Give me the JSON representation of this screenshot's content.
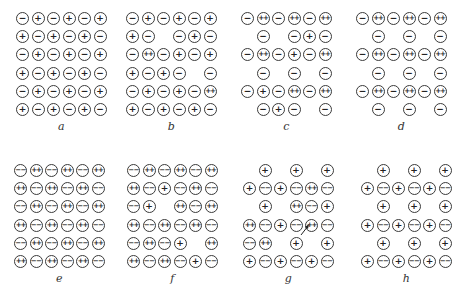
{
  "figure": {
    "panels": [
      {
        "label": "a",
        "origin": [
          16,
          12
        ],
        "rows": [
          [
            "-",
            "+",
            "-",
            "+",
            "-",
            "+"
          ],
          [
            "+",
            "-",
            "+",
            "-",
            "+",
            "-"
          ],
          [
            "-",
            "+",
            "-",
            "+",
            "-",
            "+"
          ],
          [
            "+",
            "-",
            "+",
            "-",
            "+",
            "-"
          ],
          [
            "-",
            "+",
            "-",
            "+",
            "-",
            "+"
          ],
          [
            "+",
            "-",
            "+",
            "-",
            "+",
            "-"
          ]
        ]
      },
      {
        "label": "b",
        "origin": [
          126,
          12
        ],
        "rows": [
          [
            "-",
            "+",
            "-",
            "+",
            "-",
            "+"
          ],
          [
            "+",
            "-",
            "",
            "-",
            "+",
            "-"
          ],
          [
            "-",
            "++",
            "-",
            "+",
            "-",
            "+"
          ],
          [
            "+",
            "-",
            "+",
            "-",
            "",
            "-"
          ],
          [
            "-",
            "+",
            "-",
            "+",
            "-",
            "++"
          ],
          [
            "+",
            "-",
            "+",
            "-",
            "+",
            "-"
          ]
        ]
      },
      {
        "label": "c",
        "origin": [
          241,
          12
        ],
        "rows": [
          [
            "-",
            "++",
            "-",
            "++",
            "-",
            "++"
          ],
          [
            "",
            "-",
            "",
            "-",
            "+",
            "-"
          ],
          [
            "-",
            "++",
            "-",
            "+",
            "-",
            "++"
          ],
          [
            "",
            "-",
            "",
            "-",
            "",
            "-"
          ],
          [
            "-",
            "+",
            "-",
            "++",
            "-",
            "++"
          ],
          [
            "",
            "-",
            "+",
            "-",
            "",
            "-"
          ]
        ]
      },
      {
        "label": "d",
        "origin": [
          356,
          12
        ],
        "rows": [
          [
            "-",
            "++",
            "-",
            "++",
            "-",
            "++"
          ],
          [
            "",
            "-",
            "",
            "-",
            "",
            "-"
          ],
          [
            "-",
            "++",
            "-",
            "++",
            "-",
            "++"
          ],
          [
            "",
            "-",
            "",
            "-",
            "",
            "-"
          ],
          [
            "-",
            "++",
            "-",
            "++",
            "-",
            "++"
          ],
          [
            "",
            "-",
            "",
            "-",
            "",
            "-"
          ]
        ]
      },
      {
        "label": "e",
        "origin": [
          14,
          164
        ],
        "rows": [
          [
            "--",
            "++",
            "--",
            "++",
            "--",
            "++"
          ],
          [
            "++",
            "--",
            "++",
            "--",
            "++",
            "--"
          ],
          [
            "--",
            "++",
            "--",
            "++",
            "--",
            "++"
          ],
          [
            "++",
            "--",
            "++",
            "--",
            "++",
            "--"
          ],
          [
            "--",
            "++",
            "--",
            "++",
            "--",
            "++"
          ],
          [
            "++",
            "--",
            "++",
            "--",
            "++",
            "--"
          ]
        ]
      },
      {
        "label": "f",
        "origin": [
          127,
          164
        ],
        "rows": [
          [
            "--",
            "++",
            "--",
            "++",
            "--",
            "++"
          ],
          [
            "++",
            "--",
            "+",
            "--",
            "++",
            "--"
          ],
          [
            "--",
            "+",
            "",
            "++",
            "--",
            "++"
          ],
          [
            "++",
            "--",
            "++",
            "--",
            "++",
            "--"
          ],
          [
            "--",
            "++",
            "--",
            "+",
            "",
            "++"
          ],
          [
            "++",
            "--",
            "++",
            "--",
            "+",
            "--"
          ]
        ]
      },
      {
        "label": "g",
        "origin": [
          243,
          164
        ],
        "rows": [
          [
            "",
            "+",
            "",
            "+",
            "",
            "+"
          ],
          [
            "+",
            "--",
            "+",
            "--",
            "++",
            "--"
          ],
          [
            "",
            "+",
            "",
            "++",
            "--",
            "+"
          ],
          [
            "++",
            "--",
            "+",
            "--",
            "++",
            "--"
          ],
          [
            "--",
            "++",
            "",
            "+",
            "",
            "+"
          ],
          [
            "+",
            "--",
            "+",
            "--",
            "+",
            "--"
          ]
        ],
        "annotation": "arrow pointing at row 4, column 5 (++ ion)"
      },
      {
        "label": "h",
        "origin": [
          361,
          164
        ],
        "rows": [
          [
            "",
            "+",
            "",
            "+",
            "",
            "+"
          ],
          [
            "+",
            "--",
            "+",
            "--",
            "+",
            "--"
          ],
          [
            "",
            "+",
            "",
            "+",
            "",
            "+"
          ],
          [
            "+",
            "--",
            "+",
            "--",
            "+",
            "--"
          ],
          [
            "",
            "+",
            "",
            "+",
            "",
            "+"
          ],
          [
            "+",
            "--",
            "+",
            "--",
            "+",
            "--"
          ]
        ]
      }
    ],
    "symbols": {
      "+": "+",
      "-": "−",
      "++": "++",
      "--": "−−"
    },
    "colors": {
      "stroke": "#3a3a3a",
      "text": "#222222",
      "background": "#ffffff"
    }
  }
}
